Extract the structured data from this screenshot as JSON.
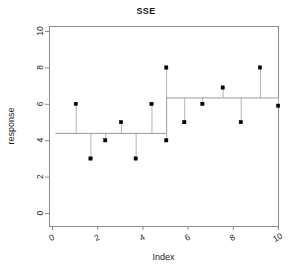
{
  "chart_data": {
    "type": "scatter",
    "title": "SSE",
    "xlabel": "Index",
    "ylabel": "response",
    "xlim": [
      0,
      10.4
    ],
    "ylim": [
      0,
      10.4
    ],
    "xticks": [
      0,
      2,
      4,
      6,
      8,
      10
    ],
    "yticks": [
      0,
      2,
      4,
      6,
      8,
      10
    ],
    "xtick_labels": [
      "0",
      "2",
      "4",
      "6",
      "8",
      "10"
    ],
    "ytick_labels": [
      "0",
      "2",
      "4",
      "6",
      "8",
      "10"
    ],
    "grid": false,
    "legend": null,
    "points": [
      {
        "x": 1.05,
        "y": 6.0
      },
      {
        "x": 1.7,
        "y": 3.0
      },
      {
        "x": 2.35,
        "y": 4.0
      },
      {
        "x": 3.05,
        "y": 5.0
      },
      {
        "x": 3.7,
        "y": 3.0
      },
      {
        "x": 4.4,
        "y": 6.0
      },
      {
        "x": 5.05,
        "y": 8.0
      },
      {
        "x": 5.05,
        "y": 4.0
      },
      {
        "x": 5.85,
        "y": 5.0
      },
      {
        "x": 6.65,
        "y": 6.0
      },
      {
        "x": 7.55,
        "y": 6.9
      },
      {
        "x": 8.35,
        "y": 5.0
      },
      {
        "x": 9.2,
        "y": 8.0
      },
      {
        "x": 10.0,
        "y": 5.9
      }
    ],
    "fit_segments": [
      {
        "x_start": 0.15,
        "x_end": 5.05,
        "y": 4.4
      },
      {
        "x_start": 5.05,
        "x_end": 10.05,
        "y": 6.35
      }
    ],
    "residual_stems": [
      {
        "x": 1.05,
        "y_point": 6.0,
        "y_fit": 4.4
      },
      {
        "x": 1.7,
        "y_point": 3.0,
        "y_fit": 4.4
      },
      {
        "x": 2.35,
        "y_point": 4.0,
        "y_fit": 4.4
      },
      {
        "x": 3.05,
        "y_point": 5.0,
        "y_fit": 4.4
      },
      {
        "x": 3.7,
        "y_point": 3.0,
        "y_fit": 4.4
      },
      {
        "x": 4.4,
        "y_point": 6.0,
        "y_fit": 4.4
      },
      {
        "x": 5.05,
        "y_point": 4.0,
        "y_fit": 4.4
      },
      {
        "x": 5.05,
        "y_point": 8.0,
        "y_fit": 6.35
      },
      {
        "x": 5.85,
        "y_point": 5.0,
        "y_fit": 6.35
      },
      {
        "x": 6.65,
        "y_point": 6.0,
        "y_fit": 6.35
      },
      {
        "x": 7.55,
        "y_point": 6.9,
        "y_fit": 6.35
      },
      {
        "x": 8.35,
        "y_point": 5.0,
        "y_fit": 6.35
      },
      {
        "x": 9.2,
        "y_point": 8.0,
        "y_fit": 6.35
      },
      {
        "x": 10.0,
        "y_point": 5.9,
        "y_fit": 6.35
      }
    ],
    "colors": {
      "point": "#000000",
      "stem": "#b4b4b4",
      "fit": "#9a9a9a",
      "axis": "#8c8c8c",
      "text": "#1a1a1a"
    }
  }
}
